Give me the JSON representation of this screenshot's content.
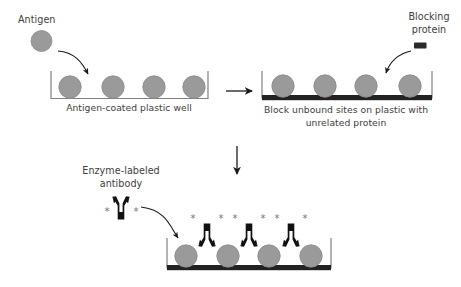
{
  "figure": {
    "type": "scientific-diagram",
    "background_color": "#ffffff",
    "colors": {
      "antigen_fill": "#9a9a9a",
      "antigen_stroke": "#8a8a8a",
      "well_wall": "#808080",
      "blocking_layer": "#222222",
      "antibody": "#111111",
      "asterisk": "#777777",
      "text": "#3d3d3d",
      "arrow": "#1a1a1a"
    }
  },
  "panels": {
    "panel1": {
      "name": "antigen-coating",
      "caption": "Antigen-coated plastic well",
      "free_label": "Antigen",
      "antigen_count": 4
    },
    "panel2": {
      "name": "blocking",
      "caption_line1": "Block unbound sites on plastic with",
      "caption_line2": "unrelated protein",
      "free_label_line1": "Blocking",
      "free_label_line2": "protein",
      "antigen_count": 4,
      "blocking_icon": "blocking-protein-rectangle"
    },
    "panel3": {
      "name": "antibody-binding",
      "free_label_line1": "Enzyme-labeled",
      "free_label_line2": "antibody",
      "antigen_count": 4,
      "bound_antibody_count": 3,
      "enzyme_marker": "*"
    }
  },
  "arrows": {
    "antigen_to_well": "curved-arrow-down-right",
    "panel1_to_panel2": "straight-arrow-right",
    "panel2_to_panel3": "straight-arrow-down",
    "blocking_to_well": "curved-arrow-down-left",
    "antibody_to_well": "curved-arrow-down-right"
  }
}
